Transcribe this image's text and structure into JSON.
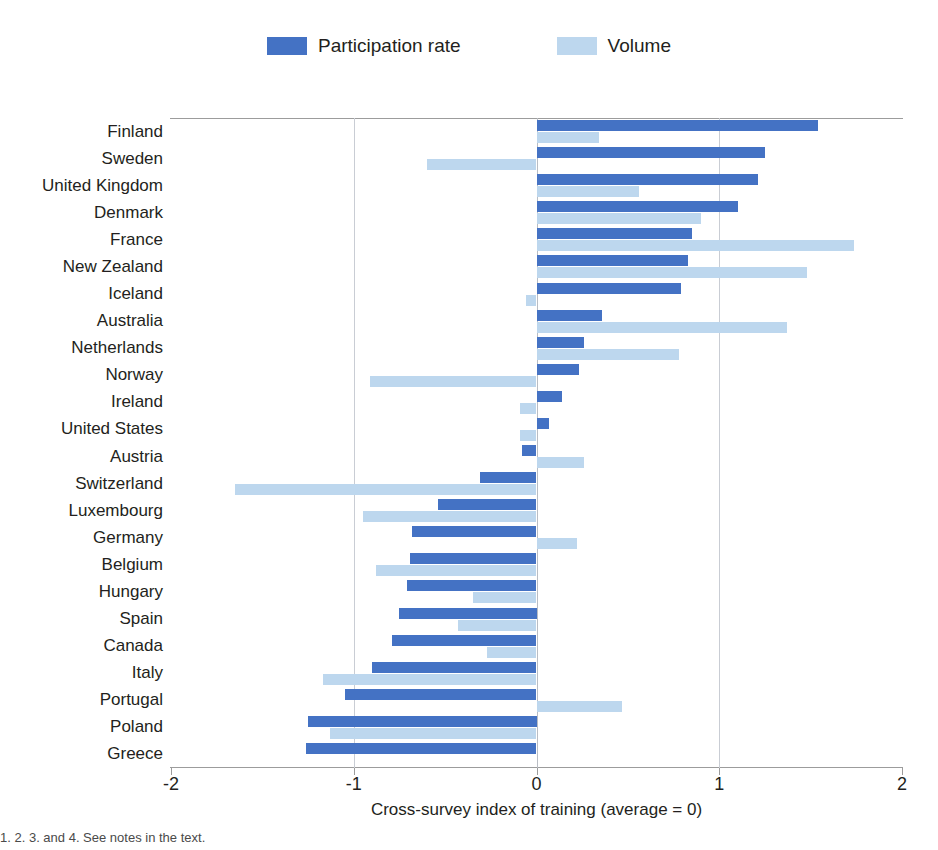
{
  "legend": {
    "entries": [
      {
        "label": "Participation rate",
        "color": "#4472c4",
        "icon": "legend-swatch-participation"
      },
      {
        "label": "Volume",
        "color": "#bdd7ee",
        "icon": "legend-swatch-volume"
      }
    ]
  },
  "axis": {
    "title": "Cross-survey index of training (average = 0)",
    "tick_labels": [
      "-2",
      "-1",
      "0",
      "1",
      "2"
    ],
    "ticks": [
      -2,
      -1,
      0,
      1,
      2
    ],
    "min": -2,
    "max": 2
  },
  "footnote": "1. 2. 3. and 4. See notes in the text.",
  "chart_data": {
    "type": "bar",
    "orientation": "horizontal",
    "title": "",
    "xlabel": "Cross-survey index of training (average = 0)",
    "ylabel": "",
    "xlim": [
      -2,
      2
    ],
    "xticks": [
      -2,
      -1,
      0,
      1,
      2
    ],
    "grid": true,
    "legend_position": "top-center",
    "categories": [
      "Finland",
      "Sweden",
      "United Kingdom",
      "Denmark",
      "France",
      "New Zealand",
      "Iceland",
      "Australia",
      "Netherlands",
      "Norway",
      "Ireland",
      "United States",
      "Austria",
      "Switzerland",
      "Luxembourg",
      "Germany",
      "Belgium",
      "Hungary",
      "Spain",
      "Canada",
      "Italy",
      "Portugal",
      "Poland",
      "Greece"
    ],
    "series": [
      {
        "name": "Participation rate",
        "color": "#4472c4",
        "values": [
          1.54,
          1.25,
          1.21,
          1.1,
          0.85,
          0.83,
          0.79,
          0.36,
          0.26,
          0.23,
          0.14,
          0.07,
          -0.08,
          -0.31,
          -0.54,
          -0.68,
          -0.69,
          -0.71,
          -0.75,
          -0.79,
          -0.9,
          -1.05,
          -1.25,
          -1.26
        ]
      },
      {
        "name": "Volume",
        "color": "#bdd7ee",
        "values": [
          0.34,
          -0.6,
          0.56,
          0.9,
          1.74,
          1.48,
          -0.06,
          1.37,
          0.78,
          -0.91,
          -0.09,
          -0.09,
          0.26,
          -1.65,
          -0.95,
          0.22,
          -0.88,
          -0.35,
          -0.43,
          -0.27,
          -1.17,
          0.47,
          -1.13,
          0.0
        ]
      }
    ]
  }
}
